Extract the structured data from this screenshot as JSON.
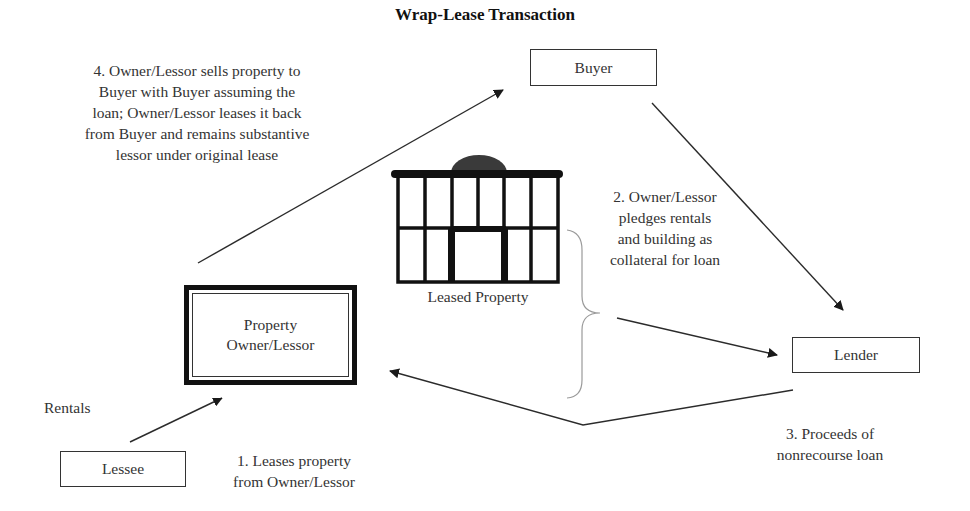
{
  "title": "Wrap-Lease Transaction",
  "nodes": {
    "buyer": "Buyer",
    "lender": "Lender",
    "lessee": "Lessee",
    "owner": [
      "Property",
      "Owner/Lessor"
    ],
    "leased_property": "Leased Property"
  },
  "steps": {
    "step1": [
      "1.  Leases property",
      "from Owner/Lessor"
    ],
    "step2": [
      "2.  Owner/Lessor",
      "pledges rentals",
      "and building as",
      "collateral for loan"
    ],
    "step3": [
      "3.  Proceeds of",
      "nonrecourse loan"
    ],
    "step4": [
      "4.  Owner/Lessor sells property to",
      "Buyer with Buyer assuming the",
      "loan; Owner/Lessor leases it back",
      "from Buyer and remains substantive",
      "lessor under original lease"
    ]
  },
  "rentals_label": "Rentals",
  "colors": {
    "line": "#2b2b2b",
    "brace": "#9a9a9a",
    "dome": "#3a3a3a"
  }
}
